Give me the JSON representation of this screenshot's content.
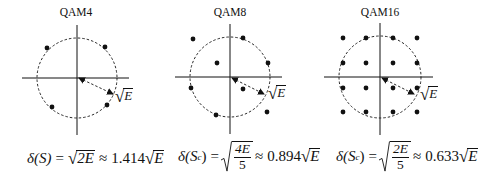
{
  "panels": [
    {
      "title": "QAM4",
      "center": [
        77,
        78
      ],
      "radius": 40,
      "points": [
        [
          47,
          48
        ],
        [
          105,
          47
        ],
        [
          52,
          107
        ],
        [
          107,
          105
        ]
      ],
      "arrow": [
        [
          79,
          78
        ],
        [
          113,
          94
        ]
      ],
      "radius_label": "E",
      "formula": {
        "lhs": "δ(S)",
        "eq": "=",
        "rad_inner": "2E",
        "approx": "≈",
        "coef": "1.414",
        "rad_tail": "E"
      }
    },
    {
      "title": "QAM8",
      "center": [
        230,
        77
      ],
      "radius": 40,
      "points": [
        [
          193,
          39
        ],
        [
          243,
          38
        ],
        [
          217,
          63
        ],
        [
          268,
          63
        ],
        [
          191,
          88
        ],
        [
          243,
          89
        ],
        [
          216,
          115
        ],
        [
          267,
          112
        ]
      ],
      "arrow": [
        [
          232,
          78
        ],
        [
          264,
          94
        ]
      ],
      "radius_label": "E",
      "formula": {
        "lhs_main": "δ(S",
        "lhs_sub": "c",
        "lhs_close": ")",
        "eq": "=",
        "num": "4E",
        "den": "5",
        "approx": "≈",
        "coef": "0.894",
        "rad_tail": "E"
      }
    },
    {
      "title": "QAM16",
      "center": [
        380,
        77
      ],
      "radius": 41,
      "points": [
        [
          343,
          38
        ],
        [
          366,
          38
        ],
        [
          393,
          38
        ],
        [
          417,
          38
        ],
        [
          343,
          63
        ],
        [
          366,
          63
        ],
        [
          393,
          63
        ],
        [
          417,
          63
        ],
        [
          343,
          88
        ],
        [
          366,
          88
        ],
        [
          393,
          88
        ],
        [
          417,
          88
        ],
        [
          343,
          112
        ],
        [
          366,
          112
        ],
        [
          393,
          112
        ],
        [
          417,
          112
        ]
      ],
      "arrow": [
        [
          382,
          78
        ],
        [
          414,
          94
        ]
      ],
      "radius_label": "E",
      "formula": {
        "lhs_main": "δ(S",
        "lhs_sub": "c",
        "lhs_close": ")",
        "eq": "=",
        "num": "2E",
        "den": "5",
        "approx": "≈",
        "coef": "0.633",
        "rad_tail": "E"
      }
    }
  ]
}
